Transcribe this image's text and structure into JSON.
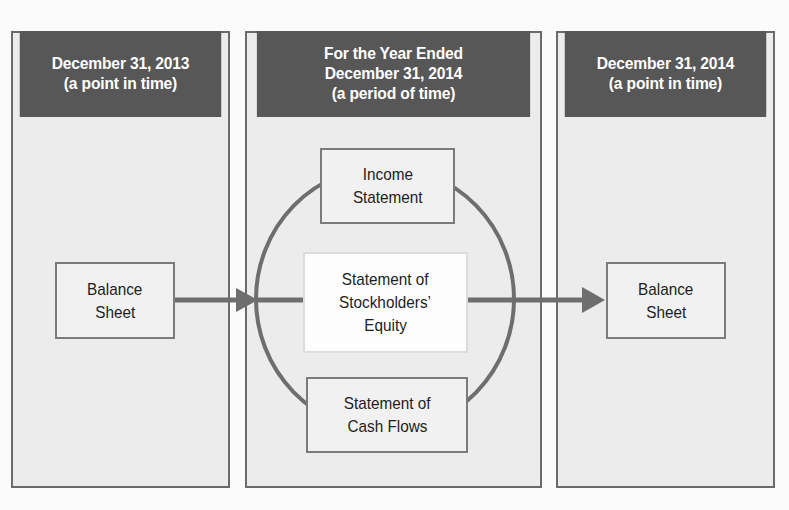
{
  "panels": [
    {
      "id": "start",
      "header": [
        "December 31, 2013",
        "(a point in time)"
      ]
    },
    {
      "id": "period",
      "header": [
        "For the Year Ended",
        "December 31, 2014",
        "(a period of time)"
      ]
    },
    {
      "id": "end",
      "header": [
        "December 31, 2014",
        "(a point in time)"
      ]
    }
  ],
  "boxes": {
    "balance_sheet_start": [
      "Balance",
      "Sheet"
    ],
    "income_statement": [
      "Income",
      "Statement"
    ],
    "stockholders_equity": [
      "Statement of",
      "Stockholders’",
      "Equity"
    ],
    "cash_flows": [
      "Statement of",
      "Cash Flows"
    ],
    "balance_sheet_end": [
      "Balance",
      "Sheet"
    ]
  },
  "colors": {
    "header_bg": "#575757",
    "panel_bg": "#ececec",
    "line": "#6e6e6e"
  }
}
